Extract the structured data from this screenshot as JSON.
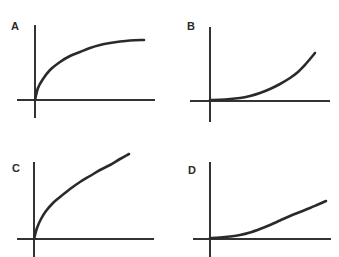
{
  "figure": {
    "line_color": "#2a2a2a",
    "background": "#ffffff",
    "panels": [
      {
        "label": "A",
        "shape": "concave-down saturating (rises steeply then levels off)",
        "label_pos": [
          11,
          22
        ],
        "y_axis": {
          "x": 35,
          "y1": 25,
          "y2": 118
        },
        "x_axis": {
          "y": 100,
          "x1": 17,
          "x2": 155
        },
        "curve_points": [
          [
            35,
            100
          ],
          [
            38,
            88
          ],
          [
            43,
            79
          ],
          [
            50,
            70
          ],
          [
            60,
            62
          ],
          [
            70,
            56
          ],
          [
            80,
            52
          ],
          [
            90,
            48
          ],
          [
            100,
            45
          ],
          [
            110,
            43
          ],
          [
            120,
            41.5
          ],
          [
            130,
            40.5
          ],
          [
            144,
            40
          ]
        ]
      },
      {
        "label": "B",
        "shape": "concave-up exponential (flat then rises steeply)",
        "label_pos": [
          187,
          22
        ],
        "y_axis": {
          "x": 210,
          "y1": 27,
          "y2": 122
        },
        "x_axis": {
          "y": 101,
          "x1": 190,
          "x2": 330
        },
        "curve_points": [
          [
            210,
            100
          ],
          [
            225,
            99.5
          ],
          [
            240,
            98
          ],
          [
            250,
            96
          ],
          [
            260,
            93
          ],
          [
            270,
            89
          ],
          [
            280,
            84
          ],
          [
            290,
            78
          ],
          [
            298,
            72
          ],
          [
            304,
            66
          ],
          [
            310,
            59
          ],
          [
            315,
            53
          ]
        ]
      },
      {
        "label": "C",
        "shape": "steep initial rise then approximately linear increase",
        "label_pos": [
          12,
          163
        ],
        "y_axis": {
          "x": 34,
          "y1": 162,
          "y2": 257
        },
        "x_axis": {
          "y": 239,
          "x1": 17,
          "x2": 154
        },
        "curve_points": [
          [
            34,
            239
          ],
          [
            37,
            228
          ],
          [
            41,
            219
          ],
          [
            46,
            211
          ],
          [
            53,
            203
          ],
          [
            60,
            197
          ],
          [
            70,
            189
          ],
          [
            80,
            182
          ],
          [
            90,
            176
          ],
          [
            100,
            170
          ],
          [
            110,
            165
          ],
          [
            120,
            159
          ],
          [
            129,
            154
          ]
        ]
      },
      {
        "label": "D",
        "shape": "flat start then approximately linear increase",
        "label_pos": [
          188,
          165
        ],
        "y_axis": {
          "x": 210,
          "y1": 162,
          "y2": 257
        },
        "x_axis": {
          "y": 239,
          "x1": 193,
          "x2": 331
        },
        "curve_points": [
          [
            210,
            238
          ],
          [
            220,
            237.5
          ],
          [
            230,
            236.5
          ],
          [
            240,
            235
          ],
          [
            250,
            232.5
          ],
          [
            260,
            229
          ],
          [
            270,
            225
          ],
          [
            280,
            220.5
          ],
          [
            290,
            216
          ],
          [
            300,
            212
          ],
          [
            310,
            208
          ],
          [
            318,
            204.5
          ],
          [
            326,
            201
          ]
        ]
      }
    ]
  },
  "chart_data": {
    "type": "line",
    "title": "",
    "xlabel": "",
    "ylabel": "",
    "grid": false,
    "legend": "none",
    "panels": [
      {
        "label": "A",
        "description": "saturating / logarithmic-like growth",
        "x": [
          0,
          0.03,
          0.07,
          0.14,
          0.23,
          0.32,
          0.41,
          0.5,
          0.6,
          0.69,
          0.78,
          0.87,
          1.0
        ],
        "y": [
          0,
          0.2,
          0.35,
          0.5,
          0.63,
          0.73,
          0.8,
          0.87,
          0.92,
          0.95,
          0.98,
          0.99,
          1.0
        ]
      },
      {
        "label": "B",
        "description": "exponential-like growth",
        "x": [
          0,
          0.14,
          0.29,
          0.38,
          0.48,
          0.57,
          0.67,
          0.76,
          0.84,
          0.89,
          0.95,
          1.0
        ],
        "y": [
          0,
          0.01,
          0.04,
          0.09,
          0.15,
          0.23,
          0.34,
          0.46,
          0.58,
          0.72,
          0.87,
          1.0
        ]
      },
      {
        "label": "C",
        "description": "square-root-like start then linear growth",
        "x": [
          0,
          0.03,
          0.07,
          0.13,
          0.2,
          0.27,
          0.38,
          0.48,
          0.59,
          0.69,
          0.8,
          0.9,
          1.0
        ],
        "y": [
          0,
          0.13,
          0.24,
          0.33,
          0.42,
          0.5,
          0.59,
          0.67,
          0.75,
          0.81,
          0.87,
          0.94,
          1.0
        ]
      },
      {
        "label": "D",
        "description": "flat start then linear growth",
        "x": [
          0,
          0.09,
          0.17,
          0.26,
          0.34,
          0.43,
          0.52,
          0.6,
          0.69,
          0.78,
          0.86,
          0.93,
          1.0
        ],
        "y": [
          0,
          0.01,
          0.04,
          0.08,
          0.15,
          0.24,
          0.35,
          0.47,
          0.59,
          0.69,
          0.8,
          0.89,
          1.0
        ]
      }
    ]
  }
}
